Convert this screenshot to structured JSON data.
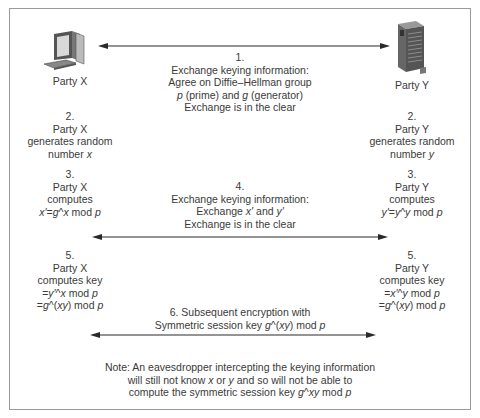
{
  "parties": {
    "x": {
      "label": "Party X",
      "icon": "desktop-computer-icon"
    },
    "y": {
      "label": "Party Y",
      "icon": "server-tower-icon"
    }
  },
  "step1": {
    "lines": [
      "1.",
      "Exchange keying information:",
      "Agree on Diffie–Hellman group",
      "p (prime) and g (generator)",
      "Exchange is in the clear"
    ]
  },
  "step2": {
    "x": [
      "2.",
      "Party X",
      "generates random",
      "number x"
    ],
    "y": [
      "2.",
      "Party Y",
      "generates random",
      "number y"
    ]
  },
  "step3": {
    "x": [
      "3.",
      "Party X",
      "computes",
      "x'=g^x mod p"
    ],
    "y": [
      "3.",
      "Party Y",
      "computes",
      "y'=y^y mod p"
    ]
  },
  "step4": {
    "lines": [
      "4.",
      "Exchange keying information:",
      "Exchange x' and y'",
      "Exchange is in the clear"
    ]
  },
  "step5": {
    "x": [
      "5.",
      "Party X",
      "computes key",
      "=y'^x mod p",
      "=g^(xy) mod p"
    ],
    "y": [
      "5.",
      "Party Y",
      "computes key",
      "=x'^y mod p",
      "=g^(xy) mod p"
    ]
  },
  "step6": {
    "lines": [
      "6. Subsequent encryption with",
      "Symmetric session key g^(xy) mod p"
    ]
  },
  "note": {
    "lines": [
      "Note: An eavesdropper intercepting the keying information",
      "will still not know x or y and so will not be able to",
      "compute the symmetric session key g^xy mod p"
    ]
  },
  "colors": {
    "text": "#3a3a3a",
    "arrow": "#2a2a2a",
    "frame": "#9a9a9a"
  }
}
